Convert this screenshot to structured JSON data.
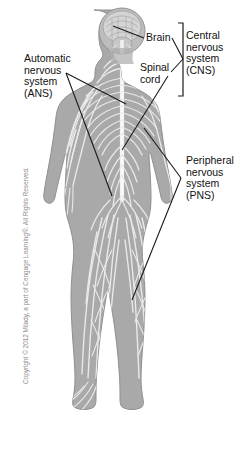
{
  "figure": {
    "background_color": "#ffffff",
    "body_fill_color": "#a9a9a9",
    "nerve_color": "#e8e8e8",
    "outline_color": "#8a8a8a",
    "leader_line_color": "#1a1a1a",
    "text_color": "#111111",
    "copyright_color": "#8c8c8c"
  },
  "labels": {
    "brain": "Brain",
    "spinal_cord": "Spinal\ncord",
    "cns": "Central\nnervous\nsystem\n(CNS)",
    "ans": "Automatic\nnervous\nsystem\n(ANS)",
    "pns": "Peripheral\nnervous\nsystem\n(PNS)"
  },
  "footer": {
    "copyright": "Copyright © 2012 Milady, a part of Cengage Learning®. All Rights Reserved."
  }
}
